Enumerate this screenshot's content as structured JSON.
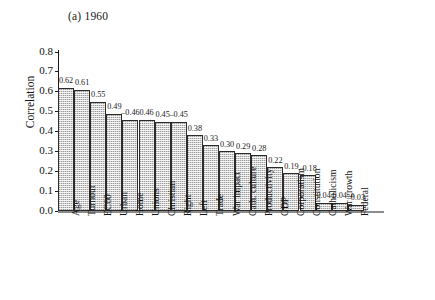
{
  "chart_data": {
    "type": "bar",
    "title": "(a) 1960",
    "xlabel": "",
    "ylabel": "Correlation",
    "ylim": [
      0.0,
      0.8
    ],
    "yticks": [
      "0.0",
      "0.1",
      "0.2",
      "0.3",
      "0.4",
      "0.5",
      "0.6",
      "0.7",
      "0.8"
    ],
    "grid": false,
    "legend": null,
    "note": "Bar heights show absolute magnitude; printed labels carry the sign.",
    "categories": [
      "Age",
      "Turnout",
      "EC60",
      "Urban",
      "Home",
      "Unions",
      "Christian",
      "Right",
      "Left",
      "Trade",
      "War impact",
      "Cath. culture",
      "Productivity",
      "GDP",
      "Corporatism",
      "Constitution",
      "Catholicism",
      "War growth",
      "Federal"
    ],
    "values": [
      0.62,
      0.61,
      0.55,
      0.49,
      -0.46,
      0.46,
      0.45,
      -0.45,
      0.38,
      0.33,
      0.3,
      0.29,
      0.28,
      0.22,
      0.19,
      -0.18,
      0.04,
      0.04,
      -0.03
    ],
    "labels": [
      "0.62",
      "0.61",
      "0.55",
      "0.49",
      "–0.46",
      "0.46",
      "0.45",
      "–0.45",
      "0.38",
      "0.33",
      "0.30",
      "0.29",
      "0.28",
      "0.22",
      "0.19",
      "–0.18",
      "0.04",
      "0.04",
      "–0.03"
    ],
    "colors": {
      "bar_fill": "#cfcfcf",
      "bar_border": "#2b2b2b",
      "axis": "#1a1a1a",
      "baseline": "#8c8c8c",
      "text": "#111111",
      "background": "#ffffff"
    }
  }
}
